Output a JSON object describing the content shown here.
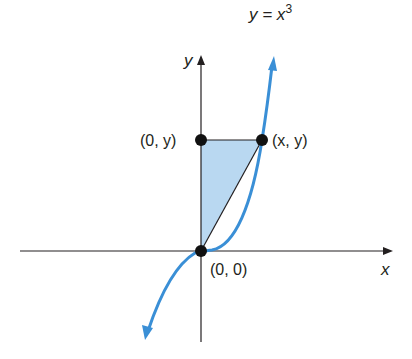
{
  "colors": {
    "curve": "#3a8fd6",
    "shade": "#b9d8f1",
    "axis": "#231f20",
    "point": "#111111"
  },
  "labels": {
    "function": "y = x",
    "function_base": "y = x",
    "function_exponent": "3",
    "x_axis": "x",
    "y_axis": "y",
    "point_top_left": "(0, y)",
    "point_top_right": "(x, y)",
    "point_origin": "(0, 0)"
  },
  "points": [
    {
      "name": "origin",
      "label": "(0, 0)"
    },
    {
      "name": "y-intercept-point",
      "label": "(0, y)"
    },
    {
      "name": "curve-point",
      "label": "(x, y)"
    }
  ]
}
